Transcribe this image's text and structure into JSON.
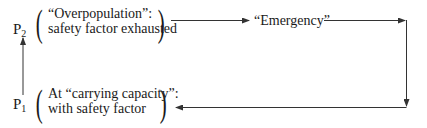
{
  "diagram": {
    "states": [
      {
        "id": "p2",
        "label": "P",
        "subscript": "2",
        "description_line1": "“Overpopulation”:",
        "description_line2": "safety factor exhausted"
      },
      {
        "id": "p1",
        "label": "P",
        "subscript": "1",
        "description_line1": "At “carrying capacity”:",
        "description_line2": "with safety factor"
      }
    ],
    "intermediate": {
      "label": "“Emergency”"
    },
    "flow": [
      "P1 -> P2",
      "P2 -> Emergency",
      "Emergency -> P1"
    ],
    "line_color": "#333333"
  }
}
